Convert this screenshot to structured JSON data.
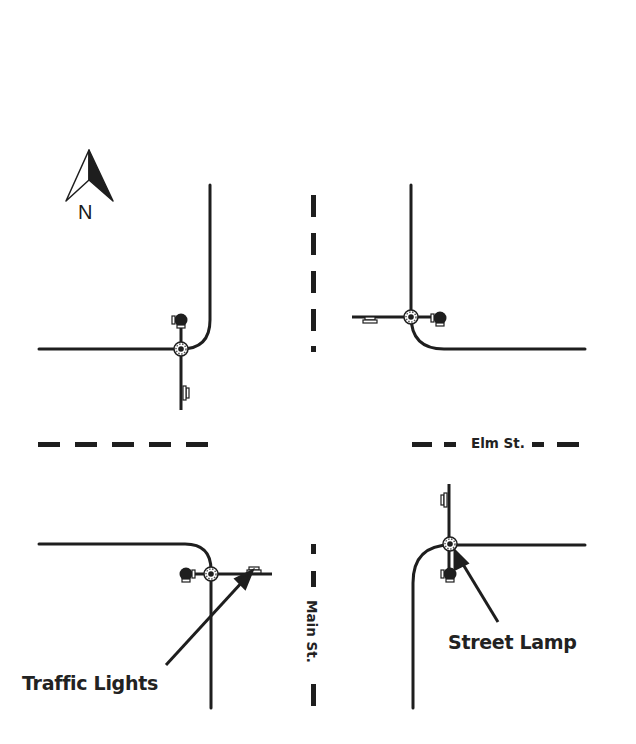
{
  "diagram": {
    "type": "street-intersection-plan",
    "compass": {
      "label": "N",
      "icon": "north-arrow-icon"
    },
    "streets": {
      "east_west": {
        "name": "Elm St."
      },
      "north_south": {
        "name": "Main St."
      }
    },
    "callouts": {
      "traffic_lights": {
        "label": "Traffic Lights",
        "icon": "traffic-light-icon"
      },
      "street_lamp": {
        "label": "Street Lamp",
        "icon": "street-lamp-icon"
      }
    },
    "corners": [
      {
        "position": "northwest",
        "fixtures": [
          "street-lamp",
          "traffic-light"
        ]
      },
      {
        "position": "northeast",
        "fixtures": [
          "street-lamp",
          "traffic-light"
        ]
      },
      {
        "position": "southwest",
        "fixtures": [
          "street-lamp",
          "traffic-light"
        ]
      },
      {
        "position": "southeast",
        "fixtures": [
          "street-lamp",
          "traffic-light"
        ]
      }
    ],
    "colors": {
      "line": "#1e1e1e",
      "background": "#ffffff",
      "text": "#222222"
    }
  }
}
